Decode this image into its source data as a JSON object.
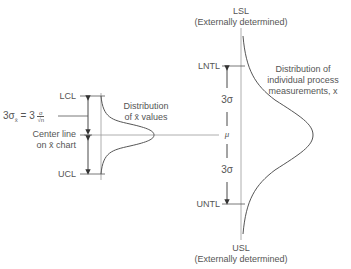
{
  "left": {
    "lcl": "LCL",
    "ucl": "UCL",
    "formula": "3σx̄ = 3 σ/√n",
    "formula_lhs": "3σ",
    "formula_sub": "x̄",
    "formula_eq": "= 3",
    "formula_num": "σ",
    "formula_den": "√n",
    "center_line_1": "Center line",
    "center_line_2": "on x̄ chart",
    "dist_label_1": "Distribution",
    "dist_label_2": "of x̄ values"
  },
  "right": {
    "lsl": "LSL",
    "lsl_note": "(Externally determined)",
    "usl": "USL",
    "usl_note": "(Externally determined)",
    "lntl": "LNTL",
    "untl": "UNTL",
    "sigma_upper": "3σ",
    "sigma_lower": "3σ",
    "mu": "μ",
    "dist_label_1": "Distribution of",
    "dist_label_2": "individual process",
    "dist_label_3": "measurements, x"
  }
}
